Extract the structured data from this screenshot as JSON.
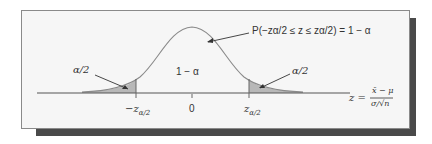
{
  "figure": {
    "probability_statement": "P(−zα/2 ≤ z ≤ zα/2) = 1 − α",
    "center_area_label": "1 − α",
    "left_tail_label": "α/2",
    "right_tail_label": "α/2",
    "tick_left": "−z",
    "tick_left_sub": "α/2",
    "tick_center": "0",
    "tick_right": "z",
    "tick_right_sub": "α/2",
    "z_label": "z =",
    "z_numerator": "x̄ − μ",
    "z_denominator": "σ/√n",
    "colors": {
      "panel": "#f6f6f6",
      "shadow": "#4a4a4a",
      "shade": "#b8b8b8",
      "curve": "#8a8a8a",
      "axis": "#555555"
    }
  }
}
